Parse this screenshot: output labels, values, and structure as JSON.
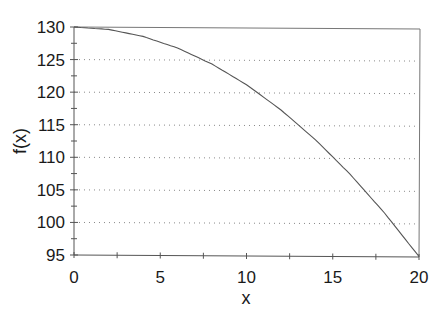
{
  "chart_data": {
    "type": "line",
    "title": "",
    "xlabel": "x",
    "ylabel": "f(x)",
    "xlim": [
      0,
      20
    ],
    "ylim": [
      95,
      130
    ],
    "x_ticks": [
      0,
      5,
      10,
      15,
      20
    ],
    "y_ticks": [
      95,
      100,
      105,
      110,
      115,
      120,
      125,
      130
    ],
    "grid": {
      "horizontal": true,
      "style": "dotted",
      "vertical": false
    },
    "legend": null,
    "series": [
      {
        "name": "f(x)",
        "x": [
          0,
          2,
          4,
          6,
          8,
          10,
          12,
          14,
          16,
          18,
          20
        ],
        "values": [
          130.0,
          129.65,
          128.6,
          126.85,
          124.4,
          121.25,
          117.4,
          112.85,
          107.6,
          101.65,
          95.0
        ]
      }
    ],
    "colors": {
      "line": "#555555",
      "axis": "#666666",
      "grid": "#888888"
    }
  },
  "labels": {
    "x_ticks": [
      "0",
      "5",
      "10",
      "15",
      "20"
    ],
    "y_ticks": [
      "130",
      "125",
      "120",
      "115",
      "110",
      "105",
      "100",
      "95"
    ],
    "xlabel": "x",
    "ylabel": "f(x)"
  }
}
